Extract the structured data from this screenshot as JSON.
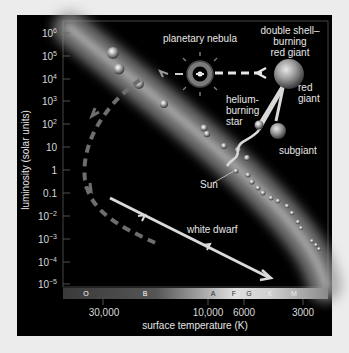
{
  "figure": {
    "x_axis_label": "surface temperature (K)",
    "y_axis_label": "luminosity (solar units)",
    "y_ticks": [
      {
        "base": "10",
        "exp": "6"
      },
      {
        "base": "10",
        "exp": "5"
      },
      {
        "base": "10",
        "exp": "4"
      },
      {
        "base": "10",
        "exp": "3"
      },
      {
        "base": "10",
        "exp": "2"
      },
      {
        "base": "10",
        "exp": ""
      },
      {
        "base": "1",
        "exp": ""
      },
      {
        "base": "0.1",
        "exp": ""
      },
      {
        "base": "10",
        "exp": "−2"
      },
      {
        "base": "10",
        "exp": "−3"
      },
      {
        "base": "10",
        "exp": "−4"
      },
      {
        "base": "10",
        "exp": "−5"
      }
    ],
    "x_ticks": [
      "30,000",
      "10,000",
      "6000",
      "3000"
    ],
    "spectral_classes": [
      "O",
      "B",
      "A",
      "F",
      "G",
      "K",
      "M"
    ],
    "annotations": {
      "planetary_nebula": "planetary nebula",
      "double_shell_line1": "double shell–",
      "double_shell_line2": "burning",
      "double_shell_line3": "red giant",
      "red_giant_line1": "red",
      "red_giant_line2": "giant",
      "helium_line1": "helium-",
      "helium_line2": "burning",
      "helium_line3": "star",
      "subgiant": "subgiant",
      "sun": "Sun",
      "white_dwarf": "white dwarf"
    },
    "colors": {
      "background": "#000000",
      "page": "#ececec",
      "track": "#d9d9d9",
      "dashed_track": "#6e6e6e",
      "main_sequence": "#9a9a9a"
    }
  }
}
